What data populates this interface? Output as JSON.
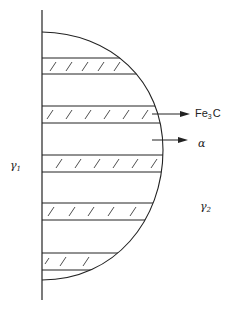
{
  "diagram": {
    "type": "pearlite-nodule-growth-schematic",
    "line_color": "#222222",
    "labels": {
      "fe3c": {
        "base": "Fe",
        "sub": "3",
        "tail": "C"
      },
      "alpha": "α",
      "gamma1": {
        "base": "γ",
        "sub": "1"
      },
      "gamma2": {
        "base": "γ",
        "sub": "2"
      }
    },
    "lamellae": [
      {
        "phase": "Fe3C",
        "top": 58,
        "bottom": 74,
        "hatched": true
      },
      {
        "phase": "Fe3C",
        "top": 106,
        "bottom": 123,
        "hatched": true
      },
      {
        "phase": "Fe3C",
        "top": 155,
        "bottom": 172,
        "hatched": true
      },
      {
        "phase": "Fe3C",
        "top": 203,
        "bottom": 220,
        "hatched": true
      },
      {
        "phase": "Fe3C",
        "top": 253,
        "bottom": 270,
        "hatched": true
      }
    ],
    "arrows": [
      {
        "target": "Fe3C",
        "y": 114
      },
      {
        "target": "alpha",
        "y": 140
      }
    ]
  }
}
